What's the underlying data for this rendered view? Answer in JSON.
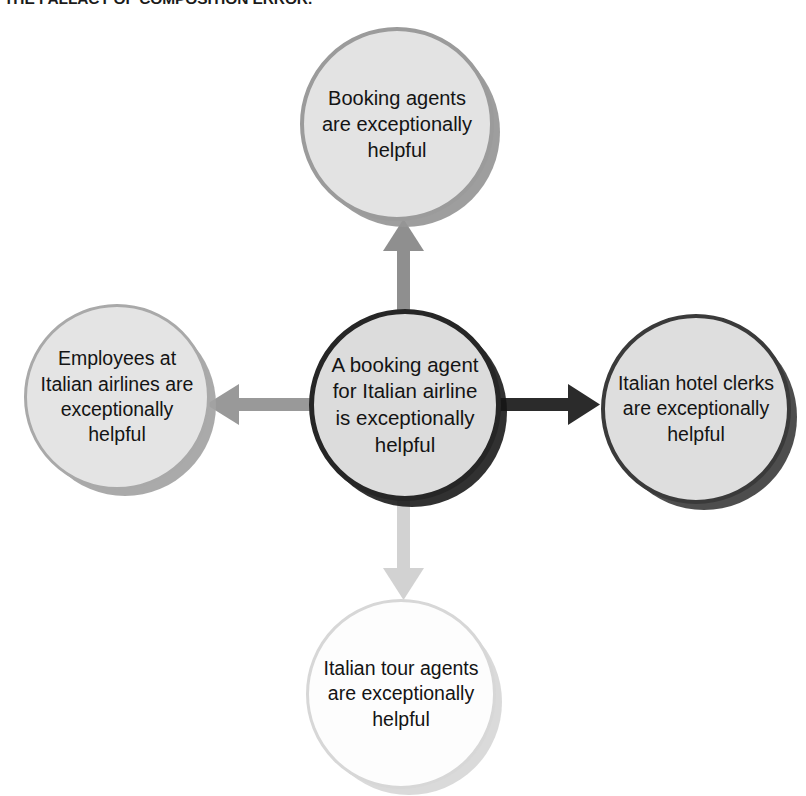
{
  "caption": {
    "text": "THE FALLACY OF COMPOSITION ERROR."
  },
  "diagram": {
    "type": "radial-concept-map",
    "center": {
      "id": "center",
      "label": "A booking agent for Italian airline is exceptionally helpful",
      "fill_color": "#dcdcdc",
      "border_color": "#262626"
    },
    "nodes": [
      {
        "id": "top",
        "position": "top",
        "label": "Booking agents are exceptionally helpful",
        "fill_color": "#e3e3e3",
        "border_color": "#9b9b9b"
      },
      {
        "id": "left",
        "position": "left",
        "label": "Employees at Italian airlines are exceptionally helpful",
        "fill_color": "#e4e4e4",
        "border_color": "#a9a9a9"
      },
      {
        "id": "right",
        "position": "right",
        "label": "Italian hotel clerks are exceptionally helpful",
        "fill_color": "#dedede",
        "border_color": "#3a3a3a"
      },
      {
        "id": "bottom",
        "position": "bottom",
        "label": "Italian tour agents are exceptionally helpful",
        "fill_color": "#fdfdfd",
        "border_color": "#d7d7d7"
      }
    ],
    "arrows": [
      {
        "id": "arrow-up",
        "from": "center",
        "to": "top",
        "direction": "up",
        "color": "#8f8f8f"
      },
      {
        "id": "arrow-right",
        "from": "center",
        "to": "right",
        "direction": "right",
        "color": "#2b2b2b"
      },
      {
        "id": "arrow-left",
        "from": "center",
        "to": "left",
        "direction": "left",
        "color": "#999999"
      },
      {
        "id": "arrow-down",
        "from": "center",
        "to": "bottom",
        "direction": "down",
        "color": "#d2d2d2"
      }
    ]
  }
}
